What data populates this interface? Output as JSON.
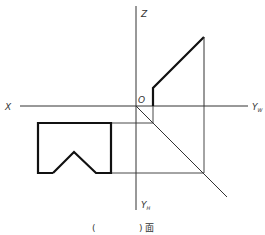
{
  "diagram": {
    "type": "orthographic-projection",
    "axes": {
      "origin_label": "O",
      "x_label": "X",
      "z_label": "Z",
      "yw_label": "Y",
      "yw_sub": "W",
      "yh_label": "Y",
      "yh_sub": "H"
    },
    "caption": {
      "open": "(",
      "close": ")",
      "suffix": "面"
    },
    "colors": {
      "line": "#2a2a2a",
      "thick": "#111111"
    }
  }
}
